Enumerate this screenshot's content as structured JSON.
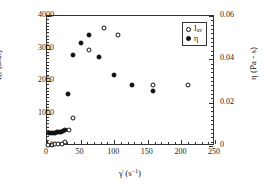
{
  "chart_data": {
    "type": "scatter",
    "title": "",
    "xlabel": "γ̇ (s⁻¹)",
    "ylabel": "I_av (a.u.)",
    "y2label": "η (Pa · s)",
    "xlim": [
      0,
      250
    ],
    "ylim": [
      0,
      4000
    ],
    "y2lim": [
      0,
      0.06
    ],
    "grid": false,
    "legend_position": "top-right",
    "xticks": [
      0,
      50,
      100,
      150,
      200,
      250
    ],
    "xtick_labels": [
      "0",
      "50",
      "100",
      "150",
      "200",
      "250"
    ],
    "xminor_step": 10,
    "yticks": [
      0,
      1000,
      2000,
      3000,
      4000
    ],
    "ytick_labels": [
      "0",
      "1000",
      "2000",
      "3000",
      "4000"
    ],
    "yminor_step": 100,
    "y2ticks": [
      0,
      0.02,
      0.04,
      0.06
    ],
    "y2tick_labels": [
      "0",
      "0.02",
      "0.04",
      "0.06"
    ],
    "y2minor_step": 0.002,
    "series": [
      {
        "name": "I_av",
        "legend_label": "I",
        "legend_sub": "av",
        "marker": "open-circle",
        "axis": "left",
        "color": "#111111",
        "points": [
          {
            "x": 2,
            "y": 40
          },
          {
            "x": 7,
            "y": 45
          },
          {
            "x": 12,
            "y": 50
          },
          {
            "x": 17,
            "y": 55
          },
          {
            "x": 22,
            "y": 60
          },
          {
            "x": 27,
            "y": 130
          },
          {
            "x": 33,
            "y": 500
          },
          {
            "x": 38,
            "y": 870
          },
          {
            "x": 63,
            "y": 2960
          },
          {
            "x": 85,
            "y": 3620
          },
          {
            "x": 105,
            "y": 3410
          },
          {
            "x": 158,
            "y": 1880
          },
          {
            "x": 210,
            "y": 1890
          }
        ]
      },
      {
        "name": "η",
        "legend_label": "η",
        "marker": "filled-circle",
        "axis": "right",
        "color": "#111111",
        "points": [
          {
            "x": 3,
            "y": 0.0058
          },
          {
            "x": 6,
            "y": 0.006
          },
          {
            "x": 9,
            "y": 0.0061
          },
          {
            "x": 12,
            "y": 0.0062
          },
          {
            "x": 15,
            "y": 0.0063
          },
          {
            "x": 18,
            "y": 0.0064
          },
          {
            "x": 21,
            "y": 0.0066
          },
          {
            "x": 24,
            "y": 0.0068
          },
          {
            "x": 27,
            "y": 0.0072
          },
          {
            "x": 31,
            "y": 0.024
          },
          {
            "x": 38,
            "y": 0.042
          },
          {
            "x": 50,
            "y": 0.0477
          },
          {
            "x": 63,
            "y": 0.0512
          },
          {
            "x": 77,
            "y": 0.041
          },
          {
            "x": 100,
            "y": 0.0327
          },
          {
            "x": 127,
            "y": 0.0282
          },
          {
            "x": 158,
            "y": 0.0252
          }
        ]
      }
    ]
  }
}
